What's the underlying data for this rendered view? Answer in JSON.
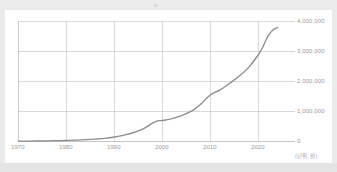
{
  "chart_data": {
    "type": "line",
    "title": "",
    "xlabel": "",
    "ylabel": "",
    "unit_note": "(단위: 원)",
    "grid": true,
    "legend": "none",
    "y_axis_position": "right",
    "xlim": [
      1968,
      2026
    ],
    "ylim": [
      0,
      4000000
    ],
    "x_tick_labels": [
      "1970",
      "1980",
      "1990",
      "2000",
      "2010",
      "2020"
    ],
    "x_ticks": [
      1970,
      1980,
      1990,
      2000,
      2010,
      2020
    ],
    "y_tick_labels": [
      "0",
      "1,000,000",
      "2,000,000",
      "3,000,000",
      "4,000,000"
    ],
    "y_ticks": [
      0,
      1000000,
      2000000,
      3000000,
      4000000
    ],
    "series": [
      {
        "name": "value",
        "color": "#8c8c8c",
        "x": [
          1970,
          1972,
          1974,
          1976,
          1978,
          1980,
          1982,
          1984,
          1986,
          1988,
          1990,
          1992,
          1994,
          1996,
          1998,
          1999,
          2000,
          2002,
          2004,
          2006,
          2007,
          2008,
          2010,
          2012,
          2014,
          2016,
          2018,
          2020,
          2021,
          2022,
          2023,
          2024
        ],
        "values": [
          9000,
          12000,
          16000,
          21000,
          28000,
          36000,
          48000,
          62000,
          80000,
          105000,
          150000,
          215000,
          300000,
          420000,
          620000,
          690000,
          700000,
          760000,
          860000,
          1010000,
          1120000,
          1250000,
          1560000,
          1720000,
          1940000,
          2180000,
          2480000,
          2900000,
          3180000,
          3520000,
          3720000,
          3800000
        ]
      }
    ]
  },
  "axis": {
    "x_labels": [
      "1970",
      "1980",
      "1990",
      "2000",
      "2010",
      "2020"
    ],
    "y_labels": [
      "4,000,000",
      "3,000,000",
      "2,000,000",
      "1,000,000",
      "0"
    ],
    "unit_note": "(단위: 원)"
  },
  "colors": {
    "line": "#8c8c8c",
    "grid": "#c9c9c9",
    "axis": "#b5b5b5",
    "tick_text": "#9a9a9a",
    "card_background": "#ffffff",
    "page_background": "#ebebeb"
  }
}
